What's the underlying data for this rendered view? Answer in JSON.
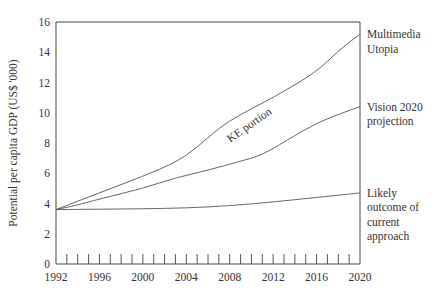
{
  "chart_data": {
    "type": "line",
    "title": "",
    "xlabel": "",
    "ylabel": "Potential per capita GDP (US$ '000)",
    "xlim": [
      1992,
      2020
    ],
    "ylim": [
      0,
      16
    ],
    "x_ticks": [
      1992,
      1996,
      2000,
      2004,
      2008,
      2012,
      2016,
      2020
    ],
    "x_tick_labels": [
      "1992",
      "1996",
      "2000",
      "2004",
      "2008",
      "2012",
      "2016",
      "2020"
    ],
    "y_ticks": [
      0,
      2,
      4,
      6,
      8,
      10,
      12,
      14,
      16
    ],
    "y_tick_labels": [
      "0",
      "2",
      "4",
      "6",
      "8",
      "10",
      "12",
      "14",
      "16"
    ],
    "minor_x_ticks_per_year": true,
    "grid": false,
    "legend": "none (series labelled at right end of lines)",
    "series": [
      {
        "name": "Multimedia Utopia",
        "label_lines": [
          "Multimedia",
          "Utopia"
        ],
        "x": [
          1992,
          1996,
          2000,
          2003,
          2005,
          2007,
          2009,
          2012,
          2016,
          2018,
          2020
        ],
        "values": [
          3.6,
          4.7,
          5.8,
          6.7,
          7.7,
          9.0,
          9.9,
          11.0,
          12.7,
          14.1,
          15.2
        ]
      },
      {
        "name": "Vision 2020 projection",
        "label_lines": [
          "Vision 2020",
          "projection"
        ],
        "x": [
          1992,
          1994,
          1996,
          2000,
          2003,
          2006,
          2009,
          2011,
          2014,
          2016,
          2018,
          2020
        ],
        "values": [
          3.6,
          3.9,
          4.3,
          5.0,
          5.7,
          6.2,
          6.8,
          7.2,
          8.5,
          9.3,
          9.9,
          10.4
        ]
      },
      {
        "name": "Likely outcome of current approach",
        "label_lines": [
          "Likely",
          "outcome of",
          "current",
          "approach"
        ],
        "x": [
          1992,
          1996,
          2000,
          2004,
          2008,
          2012,
          2016,
          2020
        ],
        "values": [
          3.6,
          3.62,
          3.65,
          3.7,
          3.85,
          4.1,
          4.4,
          4.7
        ]
      }
    ],
    "annotations": [
      {
        "text": "KE portion",
        "x": 2010,
        "y": 9.0,
        "between": [
          "Multimedia Utopia",
          "Vision 2020 projection"
        ]
      }
    ]
  }
}
